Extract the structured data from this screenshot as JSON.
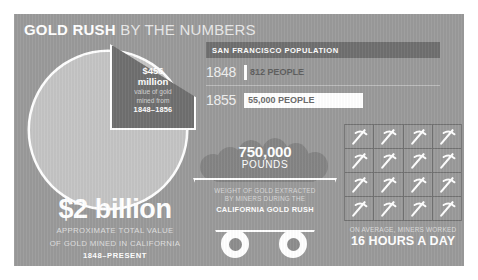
{
  "header": {
    "title_strong": "GOLD RUSH",
    "title_light": " BY THE NUMBERS"
  },
  "pie": {
    "wedge_value": "$456",
    "wedge_unit": "million",
    "wedge_caption_line1": "value of gold",
    "wedge_caption_line2": "mined from",
    "wedge_years": "1848–1856"
  },
  "total": {
    "value": "$2 billion",
    "caption_line1": "APPROXIMATE TOTAL VALUE",
    "caption_line2": "OF GOLD MINED IN CALIFORNIA",
    "years": "1848–PRESENT"
  },
  "sf_population": {
    "header": "SAN FRANCISCO POPULATION",
    "rows": [
      {
        "year": "1848",
        "value": "812 PEOPLE"
      },
      {
        "year": "1855",
        "value": "55,000 PEOPLE"
      }
    ]
  },
  "cart": {
    "number": "750,000",
    "unit": "POUNDS",
    "caption_line1": "WEIGHT OF GOLD EXTRACTED",
    "caption_line2": "BY MINERS DURING THE",
    "caption_line3": "CALIFORNIA GOLD RUSH"
  },
  "hours": {
    "caption": "ON AVERAGE, MINERS WORKED",
    "value": "16 HOURS A DAY",
    "icon_count": 16,
    "icon_name": "pickaxe-icon"
  },
  "colors": {
    "panel_background": "#9a9a9a",
    "pie_base": "#c4c4c4",
    "pie_wedge": "#6f6f6f",
    "accent_white": "#ffffff",
    "header_band": "#6f6f6f",
    "muted_text": "#d8d8d8"
  },
  "chart_data": [
    {
      "type": "pie",
      "title": "Value of gold mined in California",
      "categories": [
        "Value of gold mined from 1848–1856",
        "Remaining value mined 1857–present"
      ],
      "values": [
        456,
        1544
      ],
      "units": "millions of US dollars",
      "labels": [
        "$456 million",
        ""
      ],
      "total_label": "$2 billion",
      "total_caption": "APPROXIMATE TOTAL VALUE OF GOLD MINED IN CALIFORNIA, 1848–PRESENT",
      "exploded_slice_index": 0,
      "legend": "none"
    },
    {
      "type": "bar",
      "title": "SAN FRANCISCO POPULATION",
      "orientation": "horizontal",
      "categories": [
        "1848",
        "1855"
      ],
      "values": [
        812,
        55000
      ],
      "value_labels": [
        "812 PEOPLE",
        "55,000 PEOPLE"
      ],
      "xlabel": "",
      "ylabel": "",
      "grid": false,
      "legend": "none"
    },
    {
      "type": "pictogram",
      "title": "ON AVERAGE, MINERS WORKED 16 HOURS A DAY",
      "categories": [
        "Hours worked per day"
      ],
      "values": [
        16
      ],
      "icon": "pickaxe",
      "icon_value": 1,
      "rows": 4,
      "columns": 4,
      "legend": "none"
    }
  ]
}
